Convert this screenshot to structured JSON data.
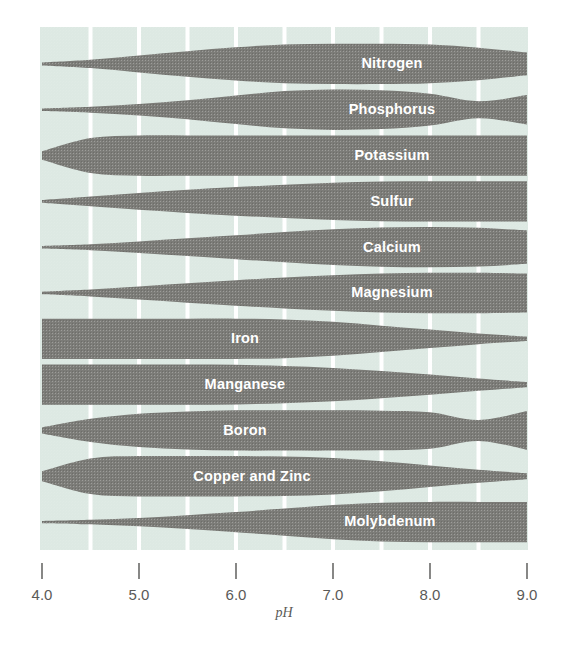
{
  "figure": {
    "background_color": "#ffffff",
    "plot_background_color": "#dde9e3",
    "band_color": "#7c7c78",
    "gridline_color": "#ffffff",
    "label_color": "#ffffff",
    "axis_text_color": "#5a5a58"
  },
  "axis": {
    "label": "pH",
    "min": 4.0,
    "max": 9.0,
    "tick_labels": [
      "4.0",
      "5.0",
      "6.0",
      "7.0",
      "8.0",
      "9.0"
    ],
    "tick_values": [
      4.0,
      5.0,
      6.0,
      7.0,
      8.0,
      9.0
    ],
    "gridline_values": [
      4.5,
      5.0,
      5.5,
      6.0,
      6.5,
      7.0,
      7.5,
      8.0,
      8.5
    ]
  },
  "chart_data": {
    "type": "area",
    "xlabel": "pH",
    "ylabel": "",
    "xlim": [
      4.0,
      9.0
    ],
    "grid": true,
    "legend": "none",
    "note": "Band thickness at each pH expresses relative plant availability of that nutrient (0 = unavailable, 1 = maximum availability).",
    "x": [
      4.0,
      4.5,
      5.0,
      5.5,
      6.0,
      6.5,
      7.0,
      7.5,
      8.0,
      8.5,
      9.0
    ],
    "series": [
      {
        "name": "Nitrogen",
        "label": "Nitrogen",
        "values": [
          0.04,
          0.18,
          0.4,
          0.62,
          0.82,
          0.96,
          1.0,
          1.0,
          0.96,
          0.8,
          0.55
        ]
      },
      {
        "name": "Phosphorus",
        "label": "Phosphorus",
        "values": [
          0.03,
          0.12,
          0.26,
          0.45,
          0.7,
          0.92,
          1.0,
          0.96,
          0.78,
          0.4,
          0.72
        ]
      },
      {
        "name": "Potassium",
        "label": "Potassium",
        "values": [
          0.18,
          0.86,
          1.0,
          1.0,
          1.0,
          1.0,
          1.0,
          1.0,
          1.0,
          1.0,
          1.0
        ]
      },
      {
        "name": "Sulfur",
        "label": "Sulfur",
        "values": [
          0.04,
          0.22,
          0.4,
          0.56,
          0.7,
          0.82,
          0.92,
          0.98,
          1.0,
          1.0,
          1.0
        ]
      },
      {
        "name": "Calcium",
        "label": "Calcium",
        "values": [
          0.03,
          0.12,
          0.26,
          0.42,
          0.58,
          0.74,
          0.88,
          0.97,
          1.0,
          0.96,
          0.82
        ]
      },
      {
        "name": "Magnesium",
        "label": "Magnesium",
        "values": [
          0.03,
          0.14,
          0.3,
          0.46,
          0.62,
          0.76,
          0.88,
          0.96,
          1.0,
          1.0,
          0.96
        ]
      },
      {
        "name": "Iron",
        "label": "Iron",
        "values": [
          1.0,
          1.0,
          1.0,
          1.0,
          1.0,
          0.96,
          0.84,
          0.64,
          0.44,
          0.24,
          0.08
        ]
      },
      {
        "name": "Manganese",
        "label": "Manganese",
        "values": [
          1.0,
          1.0,
          1.0,
          1.0,
          0.98,
          0.92,
          0.82,
          0.66,
          0.48,
          0.28,
          0.1
        ]
      },
      {
        "name": "Boron",
        "label": "Boron",
        "values": [
          0.12,
          0.56,
          0.82,
          0.94,
          1.0,
          1.0,
          1.0,
          0.98,
          0.9,
          0.5,
          0.96
        ]
      },
      {
        "name": "Copper and Zinc",
        "label": "Copper and Zinc",
        "values": [
          0.22,
          0.88,
          1.0,
          1.0,
          1.0,
          0.98,
          0.9,
          0.74,
          0.52,
          0.3,
          0.12
        ]
      },
      {
        "name": "Molybdenum",
        "label": "Molybdenum",
        "values": [
          0.02,
          0.08,
          0.18,
          0.32,
          0.48,
          0.66,
          0.84,
          0.96,
          1.0,
          1.0,
          1.0
        ]
      }
    ]
  }
}
